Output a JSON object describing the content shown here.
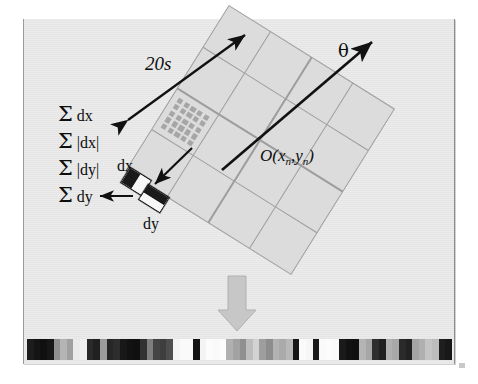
{
  "figure": {
    "background_color": "#e7e7e7",
    "page_color": "#ffffff"
  },
  "labels": {
    "scale": "20s",
    "orientation": "θ",
    "origin": "O(x",
    "origin_sub1": "n",
    "origin_mid": ",y",
    "origin_sub2": "n",
    "origin_end": ")",
    "dx": "dx",
    "dy": "dy"
  },
  "sums": [
    {
      "sigma": "Σ",
      "expr": "dx"
    },
    {
      "sigma": "Σ",
      "expr": "|dx|"
    },
    {
      "sigma": "Σ",
      "expr": "|dy|"
    },
    {
      "sigma": "Σ",
      "expr": "dy"
    }
  ],
  "grid": {
    "rows": 4,
    "cols": 4,
    "rotation_deg": 32,
    "cell_color": "#dcdcdc",
    "line_color": "#9d9d9d",
    "subgrid": {
      "rows": 5,
      "cols": 5,
      "cell_color": "#a6a6a6",
      "in_cell_index": 8
    }
  },
  "haar": {
    "dx": {
      "name": "haar-wavelet-dx",
      "dark": "#1a1a1a",
      "light": "#f7f7f7",
      "orientation": "horizontal"
    },
    "dy": {
      "name": "haar-wavelet-dy",
      "dark": "#1a1a1a",
      "light": "#f7f7f7",
      "orientation": "vertical"
    }
  },
  "arrows": {
    "scale_arrow": "double-headed",
    "orientation_arrow": "single-headed",
    "pointer_to_subregion": "single-headed",
    "sum_arrow": "single-headed",
    "flow_arrow": "block-arrow-down"
  },
  "chart_data": {
    "type": "bar",
    "xlabel": "",
    "ylabel": "",
    "categories": [
      "b1",
      "b2",
      "b3",
      "b4",
      "b5",
      "b6",
      "b7",
      "b8",
      "b9",
      "b10",
      "b11",
      "b12",
      "b13",
      "b14",
      "b15",
      "b16",
      "b17",
      "b18",
      "b19",
      "b20",
      "b21",
      "b22",
      "b23",
      "b24",
      "b25",
      "b26",
      "b27",
      "b28",
      "b29",
      "b30",
      "b31",
      "b32",
      "b33",
      "b34",
      "b35",
      "b36",
      "b37",
      "b38",
      "b39",
      "b40",
      "b41",
      "b42",
      "b43",
      "b44",
      "b45",
      "b46",
      "b47",
      "b48",
      "b49",
      "b50",
      "b51",
      "b52",
      "b53",
      "b54",
      "b55",
      "b56",
      "b57",
      "b58",
      "b59",
      "b60",
      "b61",
      "b62",
      "b63",
      "b64"
    ],
    "values": [
      18,
      14,
      12,
      16,
      96,
      120,
      108,
      230,
      236,
      40,
      30,
      150,
      36,
      42,
      20,
      16,
      14,
      48,
      86,
      64,
      60,
      74,
      246,
      250,
      250,
      18,
      246,
      252,
      250,
      252,
      120,
      108,
      96,
      170,
      206,
      112,
      106,
      132,
      128,
      136,
      20,
      250,
      248,
      26,
      250,
      252,
      250,
      24,
      18,
      16,
      130,
      124,
      44,
      30,
      146,
      134,
      40,
      34,
      120,
      128,
      186,
      176,
      30,
      24
    ],
    "grayscale": [
      "#1c1c1c",
      "#141414",
      "#101010",
      "#171717",
      "#8f8f8f",
      "#b4b4b4",
      "#a0a0a0",
      "#eaeaea",
      "#f0f0f0",
      "#2a2a2a",
      "#202020",
      "#9c9c9c",
      "#262626",
      "#2d2d2d",
      "#181818",
      "#121212",
      "#101010",
      "#323232",
      "#7e7e7e",
      "#444444",
      "#3e3e3e",
      "#4e4e4e",
      "#f4f4f4",
      "#fafafa",
      "#fafafa",
      "#141414",
      "#f4f4f4",
      "#fcfcfc",
      "#fafafa",
      "#fcfcfc",
      "#b0b0b0",
      "#a2a2a2",
      "#909090",
      "#bdbdbd",
      "#d2d2d2",
      "#9e9e9e",
      "#8d8d8d",
      "#b2b2b2",
      "#aaaaaa",
      "#b8b8b8",
      "#161616",
      "#fafafa",
      "#f6f6f6",
      "#1a1a1a",
      "#fafafa",
      "#fcfcfc",
      "#fafafa",
      "#1a1a1a",
      "#121212",
      "#101010",
      "#b4b4b4",
      "#a6a6a6",
      "#2e2e2e",
      "#202020",
      "#b0b0b0",
      "#a8a8a8",
      "#2a2a2a",
      "#222222",
      "#a4a4a4",
      "#b0b0b0",
      "#c4c4c4",
      "#bcbcbc",
      "#1e1e1e",
      "#181818"
    ],
    "ylim": [
      0,
      255
    ],
    "grid": false,
    "legend": "none"
  }
}
